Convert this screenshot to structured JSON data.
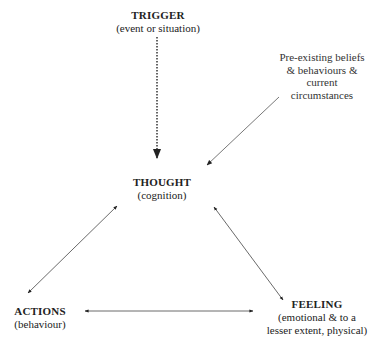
{
  "diagram": {
    "nodes": {
      "trigger": {
        "title": "TRIGGER",
        "subtitle": "(event or situation)"
      },
      "thought": {
        "title": "THOUGHT",
        "subtitle": "(cognition)"
      },
      "actions": {
        "title": "ACTIONS",
        "subtitle": "(behaviour)"
      },
      "feeling": {
        "title": "FEELING",
        "subtitle_line1": "(emotional & to a",
        "subtitle_line2": "lesser extent, physical)"
      }
    },
    "influence_note": {
      "line1": "Pre-existing beliefs",
      "line2": "& behaviours &",
      "line3": "current",
      "line4": "circumstances"
    },
    "edges": [
      {
        "from": "trigger",
        "to": "thought",
        "style": "dotted",
        "direction": "one-way"
      },
      {
        "from": "influence_note",
        "to": "thought",
        "style": "solid",
        "direction": "one-way"
      },
      {
        "from": "thought",
        "to": "actions",
        "style": "solid",
        "direction": "two-way"
      },
      {
        "from": "thought",
        "to": "feeling",
        "style": "solid",
        "direction": "two-way"
      },
      {
        "from": "actions",
        "to": "feeling",
        "style": "solid",
        "direction": "two-way"
      }
    ],
    "colors": {
      "line": "#333333",
      "text": "#222222",
      "background": "#ffffff"
    }
  }
}
